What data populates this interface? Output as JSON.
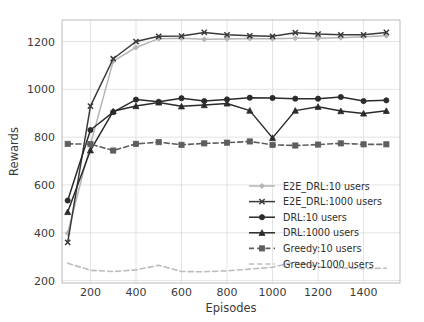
{
  "chart_data": {
    "type": "line",
    "title": "",
    "xlabel": "Episodes",
    "ylabel": "Rewards",
    "xlim": [
      75,
      1560
    ],
    "ylim": [
      190,
      1290
    ],
    "xticks": [
      200,
      400,
      600,
      800,
      1000,
      1200,
      1400
    ],
    "yticks": [
      200,
      400,
      600,
      800,
      1000,
      1200
    ],
    "grid": true,
    "legend_position": "center-right",
    "x": [
      100,
      200,
      300,
      400,
      500,
      600,
      700,
      800,
      900,
      1000,
      1100,
      1200,
      1300,
      1400,
      1500
    ],
    "series": [
      {
        "name": "E2E_DRL:10 users",
        "color": "#b5b5b5",
        "linestyle": "solid",
        "marker": "diamond",
        "values": [
          398,
          770,
          1118,
          1175,
          1212,
          1214,
          1209,
          1211,
          1213,
          1212,
          1214,
          1214,
          1216,
          1220,
          1224
        ]
      },
      {
        "name": "E2E_DRL:1000 users",
        "color": "#3a3a3a",
        "linestyle": "solid",
        "marker": "x",
        "values": [
          360,
          930,
          1128,
          1200,
          1222,
          1223,
          1238,
          1228,
          1224,
          1222,
          1237,
          1231,
          1228,
          1228,
          1238
        ]
      },
      {
        "name": "DRL:10 users",
        "color": "#2b2b2b",
        "linestyle": "solid",
        "marker": "circle",
        "values": [
          535,
          830,
          905,
          957,
          948,
          963,
          951,
          958,
          965,
          964,
          961,
          961,
          968,
          951,
          954
        ]
      },
      {
        "name": "DRL:1000 users",
        "color": "#2b2b2b",
        "linestyle": "solid",
        "marker": "triangle",
        "values": [
          487,
          745,
          908,
          930,
          945,
          929,
          934,
          941,
          911,
          797,
          911,
          927,
          909,
          899,
          910
        ]
      },
      {
        "name": "Greedy:10 users",
        "color": "#5e5e5e",
        "linestyle": "dashed",
        "marker": "square",
        "values": [
          772,
          771,
          744,
          772,
          779,
          768,
          774,
          777,
          782,
          768,
          765,
          769,
          774,
          770,
          770
        ]
      },
      {
        "name": "Greedy:1000 users",
        "color": "#bdbdbd",
        "linestyle": "dashed",
        "marker": "none",
        "values": [
          273,
          243,
          238,
          245,
          264,
          238,
          237,
          241,
          248,
          256,
          278,
          258,
          252,
          250,
          252
        ]
      }
    ]
  }
}
